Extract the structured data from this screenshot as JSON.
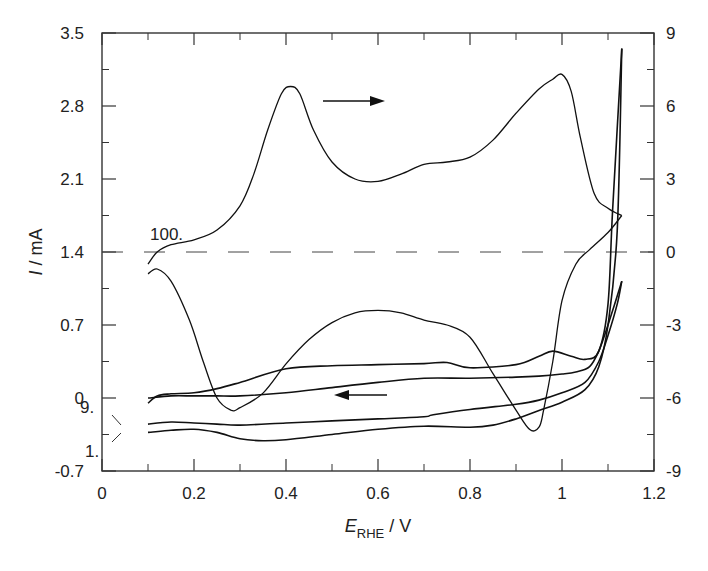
{
  "chart_data": {
    "type": "line",
    "title": "",
    "xlabel": "E_RHE / V",
    "xlabel_main": "E",
    "xlabel_sub": "RHE",
    "xlabel_unit": " / V",
    "ylabel": "I / mA",
    "ylabel_var": "I",
    "ylabel_unit": " / mA",
    "y2label": "",
    "xlim": [
      0,
      1.2
    ],
    "ylim": [
      -0.7,
      3.5
    ],
    "y2lim": [
      -9,
      9
    ],
    "grid": false,
    "legend": "none",
    "x_ticks": [
      "0",
      "0.2",
      "0.4",
      "0.6",
      "0.8",
      "1",
      "1.2"
    ],
    "x_tick_values": [
      0,
      0.2,
      0.4,
      0.6,
      0.8,
      1.0,
      1.2
    ],
    "y_ticks": [
      "-0.7",
      "0",
      "0.7",
      "1.4",
      "2.1",
      "2.8",
      "3.5"
    ],
    "y_tick_values": [
      -0.7,
      0,
      0.7,
      1.4,
      2.1,
      2.8,
      3.5
    ],
    "y2_ticks": [
      "-9",
      "-6",
      "-3",
      "0",
      "3",
      "6",
      "9"
    ],
    "y2_tick_values": [
      -9,
      -6,
      -3,
      0,
      3,
      6,
      9
    ],
    "annotations": [
      {
        "text": "100.",
        "x": 0.11,
        "y_right": 0.4
      },
      {
        "text": "9.",
        "x": 0.05,
        "y": -0.05
      },
      {
        "text": "1.",
        "x": 0.05,
        "y": -0.45
      },
      {
        "text": "arrow-right (anodic scan)",
        "x": [
          0.48,
          0.62
        ],
        "y_right": 6.4
      },
      {
        "text": "arrow-left (cathodic scan)",
        "x": [
          0.75,
          0.63
        ],
        "y": 0.02
      }
    ],
    "zero_line_right_axis": {
      "y_right": 0,
      "style": "dashed"
    },
    "series": [
      {
        "name": "Cycle 100 (right axis, mA)",
        "axis": "right",
        "anodic": {
          "x": [
            0.1,
            0.12,
            0.15,
            0.2,
            0.25,
            0.3,
            0.33,
            0.36,
            0.39,
            0.41,
            0.43,
            0.46,
            0.5,
            0.55,
            0.6,
            0.65,
            0.7,
            0.75,
            0.8,
            0.85,
            0.9,
            0.95,
            0.98,
            1.0,
            1.02,
            1.04,
            1.07,
            1.1,
            1.13
          ],
          "y": [
            -0.5,
            0.0,
            0.3,
            0.5,
            0.9,
            1.9,
            3.2,
            5.0,
            6.5,
            6.8,
            6.5,
            5.0,
            3.7,
            3.0,
            2.9,
            3.2,
            3.6,
            3.7,
            3.9,
            4.6,
            5.7,
            6.7,
            7.1,
            7.3,
            6.6,
            4.7,
            2.4,
            1.8,
            1.5
          ]
        },
        "cathodic": {
          "x": [
            1.13,
            1.1,
            1.06,
            1.03,
            1.0,
            0.98,
            0.96,
            0.95,
            0.93,
            0.9,
            0.85,
            0.8,
            0.75,
            0.7,
            0.65,
            0.6,
            0.55,
            0.5,
            0.45,
            0.4,
            0.35,
            0.3,
            0.28,
            0.25,
            0.22,
            0.19,
            0.15,
            0.12,
            0.1
          ],
          "y": [
            1.5,
            0.8,
            0.1,
            -0.5,
            -2.0,
            -4.5,
            -6.5,
            -7.2,
            -7.3,
            -6.5,
            -5.0,
            -3.5,
            -3.0,
            -2.8,
            -2.5,
            -2.4,
            -2.5,
            -2.9,
            -3.6,
            -4.6,
            -5.8,
            -6.4,
            -6.5,
            -6.0,
            -4.5,
            -2.8,
            -1.2,
            -0.7,
            -0.9
          ]
        }
      },
      {
        "name": "Cycle 9 (left axis, mA)",
        "axis": "left",
        "anodic": {
          "x": [
            0.1,
            0.15,
            0.2,
            0.25,
            0.3,
            0.4,
            0.5,
            0.6,
            0.7,
            0.72,
            0.8,
            0.9,
            0.95,
            1.0,
            1.05,
            1.08,
            1.1,
            1.12,
            1.13
          ],
          "y": [
            -0.25,
            -0.23,
            -0.24,
            -0.25,
            -0.26,
            -0.24,
            -0.22,
            -0.2,
            -0.18,
            -0.16,
            -0.11,
            -0.06,
            -0.02,
            0.05,
            0.15,
            0.35,
            0.6,
            0.9,
            1.12
          ]
        },
        "cathodic": {
          "x": [
            1.13,
            1.1,
            1.08,
            1.06,
            1.03,
            1.0,
            0.95,
            0.9,
            0.8,
            0.7,
            0.6,
            0.5,
            0.4,
            0.3,
            0.25,
            0.2,
            0.15,
            0.1
          ],
          "y": [
            1.12,
            0.7,
            0.45,
            0.3,
            0.25,
            0.23,
            0.21,
            0.2,
            0.19,
            0.19,
            0.15,
            0.1,
            0.05,
            0.02,
            0.02,
            0.02,
            0.02,
            0.0
          ]
        }
      },
      {
        "name": "Cycle 1 (left axis, mA)",
        "axis": "left",
        "anodic": {
          "x": [
            0.1,
            0.15,
            0.2,
            0.25,
            0.3,
            0.35,
            0.4,
            0.5,
            0.6,
            0.7,
            0.8,
            0.85,
            0.9,
            0.95,
            1.0,
            1.05,
            1.08,
            1.1,
            1.12,
            1.13
          ],
          "y": [
            -0.33,
            -0.31,
            -0.3,
            -0.33,
            -0.39,
            -0.41,
            -0.4,
            -0.35,
            -0.3,
            -0.27,
            -0.28,
            -0.26,
            -0.2,
            -0.12,
            -0.04,
            0.08,
            0.3,
            0.7,
            1.6,
            3.35
          ]
        },
        "cathodic": {
          "x": [
            1.13,
            1.11,
            1.1,
            1.08,
            1.05,
            1.02,
            0.98,
            0.95,
            0.9,
            0.8,
            0.75,
            0.7,
            0.6,
            0.5,
            0.4,
            0.3,
            0.25,
            0.2,
            0.15,
            0.12,
            0.1
          ],
          "y": [
            3.35,
            1.8,
            0.9,
            0.45,
            0.37,
            0.4,
            0.45,
            0.4,
            0.32,
            0.29,
            0.34,
            0.33,
            0.32,
            0.31,
            0.28,
            0.15,
            0.09,
            0.05,
            0.04,
            0.02,
            -0.05
          ]
        }
      }
    ]
  }
}
